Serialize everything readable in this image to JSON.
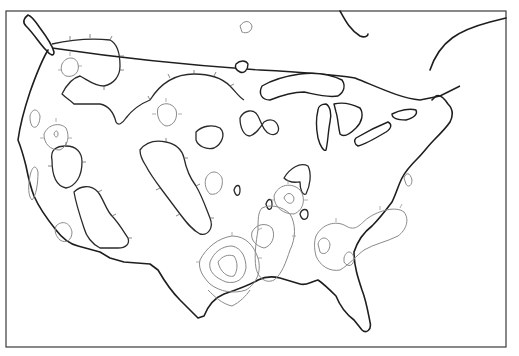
{
  "map": {
    "type": "contour-map",
    "region": "continental-united-states",
    "style": "black-and-white line drawing",
    "frame": {
      "left": 6,
      "top": 11,
      "right": 506,
      "bottom": 347
    },
    "colors": {
      "background": "#ffffff",
      "coastline": "#1e1e1e",
      "major_contour": "#2a2a2a",
      "minor_contour": "#8a8a8a",
      "frame": "#3a3a3a"
    },
    "layers": [
      "frame",
      "coastline",
      "canada-border",
      "great-lakes",
      "major-contours-hachured",
      "minor-contours-hachured"
    ],
    "labels": []
  }
}
